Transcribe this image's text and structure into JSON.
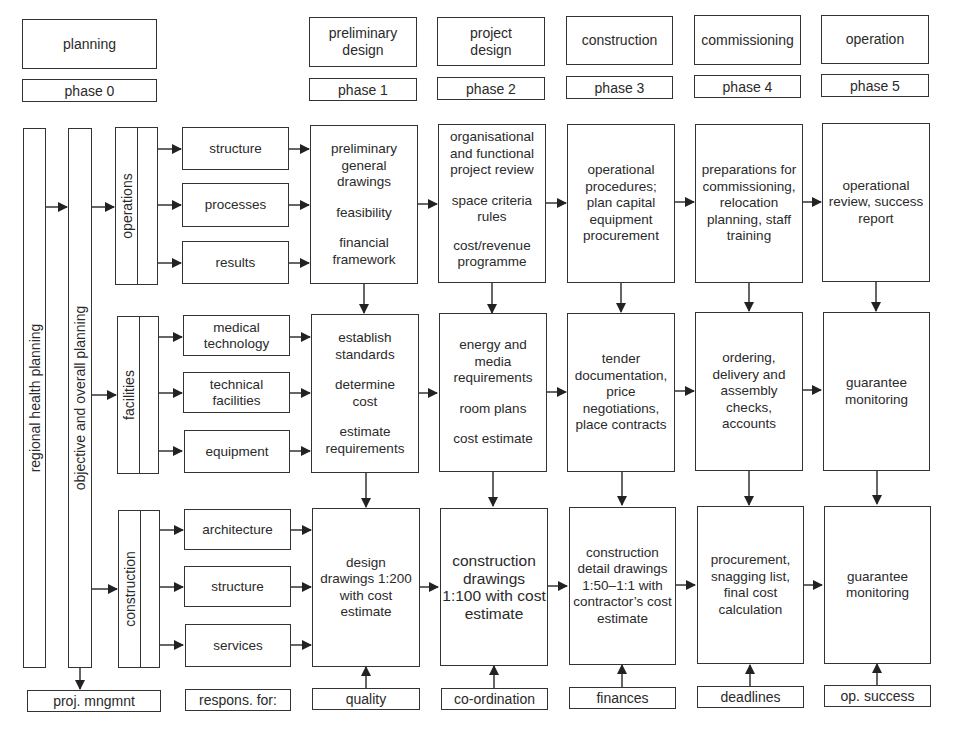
{
  "header": {
    "stages": [
      {
        "label": "planning",
        "phase": "phase 0"
      },
      {
        "label": "preliminary design",
        "phase": "phase 1"
      },
      {
        "label": "project design",
        "phase": "phase 2"
      },
      {
        "label": "construction",
        "phase": "phase 3"
      },
      {
        "label": "commissioning",
        "phase": "phase 4"
      },
      {
        "label": "operation",
        "phase": "phase 5"
      }
    ]
  },
  "left_bars": {
    "regional": "regional health planning",
    "objective": "objective and overall planning"
  },
  "groups": [
    {
      "label": "operations",
      "items": [
        "structure",
        "processes",
        "results"
      ]
    },
    {
      "label": "facilities",
      "items": [
        "medical technology",
        "technical facilities",
        "equipment"
      ]
    },
    {
      "label": "construction",
      "items": [
        "architecture",
        "structure",
        "services"
      ]
    }
  ],
  "grid": {
    "operations": [
      [
        "preliminary general drawings",
        "feasibility",
        "financial framework"
      ],
      [
        "organisational and functional project review",
        "space criteria rules",
        "cost/revenue programme"
      ],
      [
        "operational procedures; plan capital equipment procurement"
      ],
      [
        "preparations for commissioning, relocation planning, staff training"
      ],
      [
        "operational review, success report"
      ]
    ],
    "facilities": [
      [
        "establish standards",
        "determine cost",
        "estimate requirements"
      ],
      [
        "energy and media requirements",
        "room plans",
        "cost estimate"
      ],
      [
        "tender documentation, price negotiations, place contracts"
      ],
      [
        "ordering, delivery and assembly checks, accounts"
      ],
      [
        "guarantee monitoring"
      ]
    ],
    "construction": [
      [
        "design drawings 1:200 with cost estimate"
      ],
      [
        "construction drawings 1:100 with cost estimate"
      ],
      [
        "construction detail drawings 1:50–1:1 with contractor’s cost estimate"
      ],
      [
        "procurement, snagging list, final cost calculation"
      ],
      [
        "guarantee monitoring"
      ]
    ]
  },
  "footer": {
    "proj_mngmnt": "proj. mngmnt",
    "respons_for": "respons. for:",
    "responsibilities": [
      "quality",
      "co-ordination",
      "finances",
      "deadlines",
      "op. success"
    ]
  },
  "colors": {
    "line": "#333333",
    "text": "#2a2a2a",
    "background": "#ffffff"
  }
}
